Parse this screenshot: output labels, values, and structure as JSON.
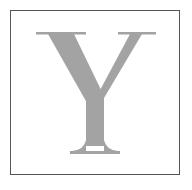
{
  "tile": {
    "letter": "Y",
    "letter_color": "#a3a3a3",
    "border_color": "#555555",
    "background_color": "#ffffff"
  }
}
